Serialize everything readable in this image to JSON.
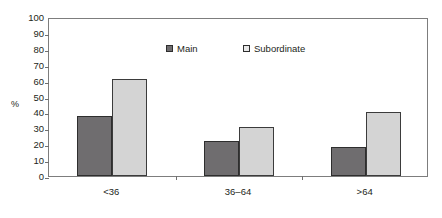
{
  "chart_data": {
    "type": "bar",
    "title": "",
    "xlabel": "",
    "ylabel": "%",
    "categories": [
      "<36",
      "36–64",
      ">64"
    ],
    "series": [
      {
        "name": "Main",
        "color": "#6f6d6f",
        "values": [
          38,
          22,
          18
        ]
      },
      {
        "name": "Subordinate",
        "color": "#d4d4d4",
        "values": [
          61,
          31,
          40
        ]
      }
    ],
    "ylim": [
      0,
      100
    ],
    "ytick_step": 10,
    "yticks": [
      "0",
      "10",
      "20",
      "30",
      "40",
      "50",
      "60",
      "70",
      "80",
      "90",
      "100"
    ],
    "grid": false,
    "legend_position": "top-center"
  },
  "axis": {
    "y_title": "%",
    "y_ticks": [
      "100",
      "90",
      "80",
      "70",
      "60",
      "50",
      "40",
      "30",
      "20",
      "10",
      "0"
    ],
    "x_categories": [
      "<36",
      "36–64",
      ">64"
    ]
  },
  "legend": {
    "entries": [
      {
        "label": "Main",
        "swatch": "legend-swatch-main"
      },
      {
        "label": "Subordinate",
        "swatch": "legend-swatch-subordinate"
      }
    ]
  },
  "colors": {
    "main": "#6f6d6f",
    "subordinate": "#d4d4d4",
    "axis": "#7d7d7d",
    "text": "#231f20"
  }
}
